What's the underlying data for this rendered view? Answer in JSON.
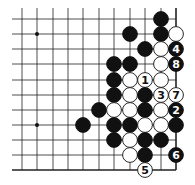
{
  "board": {
    "grid": {
      "columns_x": [
        22,
        37,
        53,
        68,
        83,
        99,
        114,
        130,
        145,
        161,
        176
      ],
      "rows_y": [
        19,
        34,
        49,
        64,
        80,
        95,
        110,
        125,
        140,
        155,
        170
      ],
      "line_left": 12,
      "line_top": 8,
      "right_edge": true,
      "bottom_edge": true
    },
    "star_points": [
      [
        1,
        1
      ],
      [
        1,
        7
      ]
    ],
    "stones": [
      {
        "c": 9,
        "r": 0,
        "color": "black"
      },
      {
        "c": 7,
        "r": 1,
        "color": "black"
      },
      {
        "c": 9,
        "r": 1,
        "color": "black"
      },
      {
        "c": 10,
        "r": 1,
        "color": "white"
      },
      {
        "c": 8,
        "r": 2,
        "color": "black"
      },
      {
        "c": 9,
        "r": 2,
        "color": "white"
      },
      {
        "c": 10,
        "r": 2,
        "color": "black",
        "label": "4"
      },
      {
        "c": 6,
        "r": 3,
        "color": "black"
      },
      {
        "c": 7,
        "r": 3,
        "color": "black"
      },
      {
        "c": 9,
        "r": 3,
        "color": "white"
      },
      {
        "c": 10,
        "r": 3,
        "color": "black",
        "label": "8"
      },
      {
        "c": 6,
        "r": 4,
        "color": "black"
      },
      {
        "c": 7,
        "r": 4,
        "color": "white"
      },
      {
        "c": 8,
        "r": 4,
        "color": "white",
        "label": "1"
      },
      {
        "c": 9,
        "r": 4,
        "color": "white"
      },
      {
        "c": 6,
        "r": 5,
        "color": "black"
      },
      {
        "c": 7,
        "r": 5,
        "color": "white"
      },
      {
        "c": 8,
        "r": 5,
        "color": "black"
      },
      {
        "c": 9,
        "r": 5,
        "color": "white",
        "label": "3"
      },
      {
        "c": 10,
        "r": 5,
        "color": "white",
        "label": "7"
      },
      {
        "c": 5,
        "r": 6,
        "color": "black"
      },
      {
        "c": 6,
        "r": 6,
        "color": "white"
      },
      {
        "c": 7,
        "r": 6,
        "color": "white"
      },
      {
        "c": 8,
        "r": 6,
        "color": "black"
      },
      {
        "c": 9,
        "r": 6,
        "color": "white"
      },
      {
        "c": 10,
        "r": 6,
        "color": "black",
        "label": "2"
      },
      {
        "c": 4,
        "r": 7,
        "color": "black"
      },
      {
        "c": 6,
        "r": 7,
        "color": "black"
      },
      {
        "c": 7,
        "r": 7,
        "color": "black"
      },
      {
        "c": 8,
        "r": 7,
        "color": "white"
      },
      {
        "c": 9,
        "r": 7,
        "color": "white"
      },
      {
        "c": 10,
        "r": 7,
        "color": "black"
      },
      {
        "c": 6,
        "r": 8,
        "color": "black"
      },
      {
        "c": 7,
        "r": 8,
        "color": "white"
      },
      {
        "c": 8,
        "r": 8,
        "color": "black"
      },
      {
        "c": 9,
        "r": 8,
        "color": "black"
      },
      {
        "c": 7,
        "r": 9,
        "color": "white"
      },
      {
        "c": 8,
        "r": 9,
        "color": "black"
      },
      {
        "c": 10,
        "r": 9,
        "color": "black",
        "label": "6"
      },
      {
        "c": 8,
        "r": 10,
        "color": "white",
        "label": "5"
      }
    ]
  }
}
